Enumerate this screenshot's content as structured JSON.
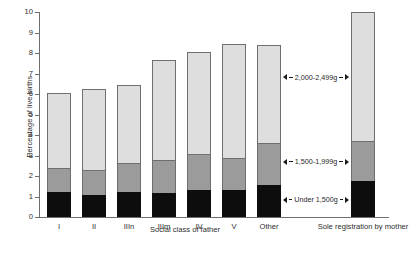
{
  "chart_data": {
    "type": "bar",
    "subtype": "stacked-bar",
    "title": "",
    "xlabel": "Social class of father",
    "ylabel": "Percentage of live births",
    "ylim": [
      0,
      10
    ],
    "yticks": [
      0,
      1,
      2,
      3,
      4,
      5,
      6,
      7,
      8,
      9,
      10
    ],
    "ytick_labels": [
      "0",
      "1",
      "2",
      "3",
      "4",
      "5",
      "6",
      "7",
      "8",
      "9",
      "10"
    ],
    "grid": false,
    "legend_position": "inline-annotations",
    "categories": [
      "I",
      "II",
      "IIIn",
      "IIIm",
      "IV",
      "V",
      "Other",
      "Sole registration by mother"
    ],
    "series": [
      {
        "name": "Under 1,500g",
        "values": [
          1.2,
          1.05,
          1.2,
          1.15,
          1.3,
          1.3,
          1.55,
          1.75
        ]
      },
      {
        "name": "1,500-1,999g",
        "values": [
          1.2,
          1.25,
          1.45,
          1.65,
          1.75,
          1.6,
          2.05,
          1.95
        ]
      },
      {
        "name": "2,000-2,499g",
        "values": [
          3.65,
          3.95,
          3.8,
          4.85,
          5.0,
          5.55,
          4.8,
          6.3
        ]
      }
    ],
    "totals": [
      6.05,
      6.25,
      6.45,
      7.65,
      8.05,
      8.45,
      8.4,
      10.0
    ],
    "annotations": [
      {
        "text": "2,000-2,499g",
        "series": "2,000-2,499g"
      },
      {
        "text": "1,500-1,999g",
        "series": "1,500-1,999g"
      },
      {
        "text": "Under 1,500g",
        "series": "Under 1,500g"
      }
    ],
    "colors": {
      "under_1500g": "#0d0d0d",
      "g1500_1999": "#9b9b9b",
      "g2000_2499": "#dedede",
      "axis": "#6e6e6e",
      "text": "#2e2e2e"
    }
  }
}
